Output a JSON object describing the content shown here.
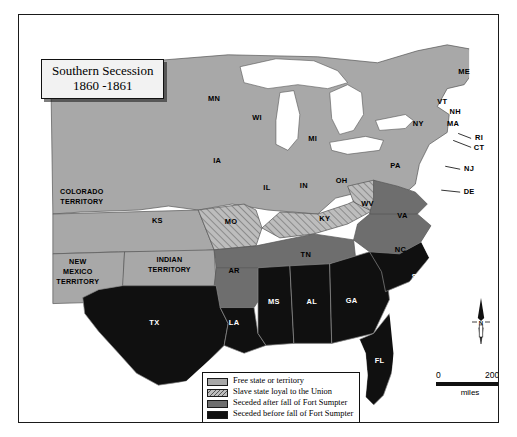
{
  "title": {
    "line1": "Southern Secession",
    "line2": "1860 -1861"
  },
  "credit": "Rutgers Cartography 2000",
  "legend": {
    "items": [
      {
        "label": "Free state or territory",
        "swatch": "free",
        "color": "#a8a8a8"
      },
      {
        "label": "Slave state loyal to the Union",
        "swatch": "loyal-hatched",
        "color": "#bdbdbd"
      },
      {
        "label": "Seceded after fall of Fort Sumpter",
        "swatch": "after",
        "color": "#6e6e6e"
      },
      {
        "label": "Seceded before fall of Fort Sumpter",
        "swatch": "before",
        "color": "#101010"
      }
    ]
  },
  "scalebar": {
    "min": "0",
    "max": "200",
    "units": "miles"
  },
  "compass": {
    "label": "N"
  },
  "map": {
    "water_color": "#ffffff",
    "border_color": "#555555",
    "labels": {
      "free_states": [
        {
          "code": "MN",
          "x": 196,
          "y": 84
        },
        {
          "code": "WI",
          "x": 239,
          "y": 104
        },
        {
          "code": "MI",
          "x": 295,
          "y": 125
        },
        {
          "code": "IA",
          "x": 199,
          "y": 147
        },
        {
          "code": "IL",
          "x": 249,
          "y": 174
        },
        {
          "code": "IN",
          "x": 286,
          "y": 172
        },
        {
          "code": "OH",
          "x": 324,
          "y": 167
        },
        {
          "code": "PA",
          "x": 378,
          "y": 152
        },
        {
          "code": "NY",
          "x": 401,
          "y": 110
        },
        {
          "code": "ME",
          "x": 447,
          "y": 57
        },
        {
          "code": "VT",
          "x": 425,
          "y": 87
        },
        {
          "code": "NH",
          "x": 438,
          "y": 98
        },
        {
          "code": "MA",
          "x": 436,
          "y": 110
        },
        {
          "code": "RI",
          "x": 462,
          "y": 124
        },
        {
          "code": "CT",
          "x": 462,
          "y": 134
        },
        {
          "code": "NJ",
          "x": 452,
          "y": 155
        },
        {
          "code": "DE",
          "x": 452,
          "y": 178
        },
        {
          "code": "KS",
          "x": 139,
          "y": 207
        }
      ],
      "loyal_slave_states": [
        {
          "code": "MO",
          "x": 213,
          "y": 208
        },
        {
          "code": "KY",
          "x": 307,
          "y": 205
        },
        {
          "code": "WV",
          "x": 350,
          "y": 190
        }
      ],
      "seceded_after": [
        {
          "code": "VA",
          "x": 385,
          "y": 202
        },
        {
          "code": "NC",
          "x": 383,
          "y": 236
        },
        {
          "code": "TN",
          "x": 288,
          "y": 241
        },
        {
          "code": "AR",
          "x": 216,
          "y": 257
        }
      ],
      "seceded_before": [
        {
          "code": "SC",
          "x": 400,
          "y": 263
        },
        {
          "code": "GA",
          "x": 334,
          "y": 287
        },
        {
          "code": "AL",
          "x": 294,
          "y": 288
        },
        {
          "code": "MS",
          "x": 256,
          "y": 288
        },
        {
          "code": "LA",
          "x": 216,
          "y": 310
        },
        {
          "code": "TX",
          "x": 136,
          "y": 310
        },
        {
          "code": "FL",
          "x": 362,
          "y": 348
        }
      ],
      "territories": [
        {
          "name": [
            "COLORADO",
            "TERRITORY"
          ],
          "x": 63,
          "y": 180,
          "fill": "free"
        },
        {
          "name": [
            "NEW",
            "MEXICO",
            "TERRITORY"
          ],
          "x": 59,
          "y": 250,
          "fill": "free"
        },
        {
          "name": [
            "INDIAN",
            "TERRITORY"
          ],
          "x": 151,
          "y": 248,
          "fill": "free"
        }
      ]
    }
  }
}
